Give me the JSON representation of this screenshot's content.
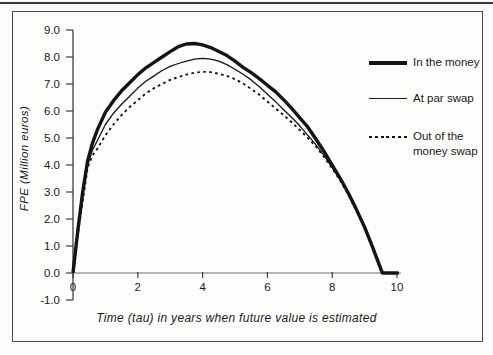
{
  "figure": {
    "x_axis_label": "Time (tau) in years when future value is estimated",
    "y_axis_label": "FPE  (Million euros)"
  },
  "legend": {
    "position": "right",
    "items": [
      {
        "label": "In the money",
        "style": "thick-solid"
      },
      {
        "label": "At par swap",
        "style": "thin-solid"
      },
      {
        "label": "Out of the money swap",
        "style": "dotted"
      }
    ]
  },
  "colors": {
    "line": "#141414",
    "axis": "#3f3f3f",
    "x_axis_line": "#6e6e6e",
    "text": "#1a1a1a",
    "background": "#fdfdfc",
    "box_border": "#4a4a4a"
  },
  "chart_data": {
    "type": "line",
    "title": "",
    "xlabel": "Time (tau) in years when future value is estimated",
    "ylabel": "FPE (Million euros)",
    "xlim": [
      0,
      10
    ],
    "ylim": [
      -1.0,
      9.0
    ],
    "x_ticks": [
      0,
      2,
      4,
      6,
      8,
      10
    ],
    "y_ticks": [
      9.0,
      8.0,
      7.0,
      6.0,
      5.0,
      4.0,
      3.0,
      2.0,
      1.0,
      0.0,
      -1.0
    ],
    "grid": false,
    "legend_position": "right",
    "series": [
      {
        "name": "In the money",
        "line": "thick-solid",
        "points": [
          [
            0,
            0
          ],
          [
            0.15,
            1.6
          ],
          [
            0.3,
            3.0
          ],
          [
            0.45,
            4.15
          ],
          [
            0.6,
            4.8
          ],
          [
            0.75,
            5.3
          ],
          [
            1,
            5.95
          ],
          [
            1.25,
            6.38
          ],
          [
            1.5,
            6.75
          ],
          [
            1.75,
            7.05
          ],
          [
            2,
            7.35
          ],
          [
            2.25,
            7.6
          ],
          [
            2.5,
            7.8
          ],
          [
            2.75,
            8.0
          ],
          [
            3,
            8.2
          ],
          [
            3.25,
            8.38
          ],
          [
            3.5,
            8.48
          ],
          [
            3.75,
            8.5
          ],
          [
            4,
            8.45
          ],
          [
            4.25,
            8.35
          ],
          [
            4.5,
            8.2
          ],
          [
            4.75,
            8.05
          ],
          [
            5,
            7.85
          ],
          [
            5.25,
            7.62
          ],
          [
            5.5,
            7.42
          ],
          [
            5.75,
            7.2
          ],
          [
            6,
            6.95
          ],
          [
            6.25,
            6.72
          ],
          [
            6.5,
            6.42
          ],
          [
            6.75,
            6.1
          ],
          [
            7,
            5.75
          ],
          [
            7.25,
            5.4
          ],
          [
            7.5,
            4.95
          ],
          [
            7.75,
            4.5
          ],
          [
            8,
            4.0
          ],
          [
            8.25,
            3.5
          ],
          [
            8.5,
            2.95
          ],
          [
            8.75,
            2.35
          ],
          [
            9,
            1.7
          ],
          [
            9.25,
            0.95
          ],
          [
            9.5,
            0.15
          ],
          [
            9.55,
            0
          ],
          [
            10.05,
            0
          ]
        ]
      },
      {
        "name": "At par swap",
        "line": "thin-solid",
        "points": [
          [
            0,
            0
          ],
          [
            0.15,
            1.5
          ],
          [
            0.3,
            2.8
          ],
          [
            0.45,
            4.0
          ],
          [
            0.6,
            4.55
          ],
          [
            0.75,
            4.9
          ],
          [
            1,
            5.5
          ],
          [
            1.25,
            5.92
          ],
          [
            1.5,
            6.25
          ],
          [
            1.75,
            6.55
          ],
          [
            2,
            6.85
          ],
          [
            2.25,
            7.1
          ],
          [
            2.5,
            7.3
          ],
          [
            2.75,
            7.5
          ],
          [
            3,
            7.65
          ],
          [
            3.25,
            7.76
          ],
          [
            3.5,
            7.85
          ],
          [
            3.75,
            7.92
          ],
          [
            4,
            7.95
          ],
          [
            4.25,
            7.92
          ],
          [
            4.5,
            7.85
          ],
          [
            4.75,
            7.72
          ],
          [
            5,
            7.55
          ],
          [
            5.25,
            7.36
          ],
          [
            5.5,
            7.15
          ],
          [
            5.75,
            6.9
          ],
          [
            6,
            6.62
          ],
          [
            6.25,
            6.35
          ],
          [
            6.5,
            6.05
          ],
          [
            6.75,
            5.76
          ],
          [
            7,
            5.45
          ],
          [
            7.25,
            5.1
          ],
          [
            7.5,
            4.75
          ],
          [
            7.75,
            4.35
          ],
          [
            8,
            3.9
          ],
          [
            8.25,
            3.45
          ],
          [
            8.5,
            2.92
          ],
          [
            8.75,
            2.32
          ],
          [
            9,
            1.68
          ],
          [
            9.25,
            0.93
          ],
          [
            9.5,
            0.13
          ],
          [
            9.6,
            0
          ],
          [
            10.05,
            0
          ]
        ]
      },
      {
        "name": "Out of the money swap",
        "line": "dotted",
        "points": [
          [
            0,
            0
          ],
          [
            0.15,
            1.45
          ],
          [
            0.3,
            2.65
          ],
          [
            0.45,
            3.9
          ],
          [
            0.6,
            4.35
          ],
          [
            0.75,
            4.6
          ],
          [
            1,
            5.1
          ],
          [
            1.25,
            5.5
          ],
          [
            1.5,
            5.85
          ],
          [
            1.75,
            6.15
          ],
          [
            2,
            6.4
          ],
          [
            2.25,
            6.65
          ],
          [
            2.5,
            6.85
          ],
          [
            2.75,
            7.0
          ],
          [
            3,
            7.15
          ],
          [
            3.25,
            7.26
          ],
          [
            3.5,
            7.35
          ],
          [
            3.75,
            7.42
          ],
          [
            4,
            7.45
          ],
          [
            4.25,
            7.44
          ],
          [
            4.5,
            7.38
          ],
          [
            4.75,
            7.3
          ],
          [
            5,
            7.18
          ],
          [
            5.25,
            7.02
          ],
          [
            5.5,
            6.82
          ],
          [
            5.75,
            6.6
          ],
          [
            6,
            6.35
          ],
          [
            6.25,
            6.1
          ],
          [
            6.5,
            5.85
          ],
          [
            6.75,
            5.58
          ],
          [
            7,
            5.3
          ],
          [
            7.25,
            5.0
          ],
          [
            7.5,
            4.68
          ],
          [
            7.75,
            4.3
          ],
          [
            8,
            3.87
          ],
          [
            8.25,
            3.42
          ],
          [
            8.5,
            2.9
          ],
          [
            8.75,
            2.3
          ],
          [
            9,
            1.65
          ],
          [
            9.25,
            0.9
          ],
          [
            9.5,
            0.1
          ],
          [
            9.6,
            0
          ],
          [
            10.05,
            0
          ]
        ]
      }
    ]
  }
}
